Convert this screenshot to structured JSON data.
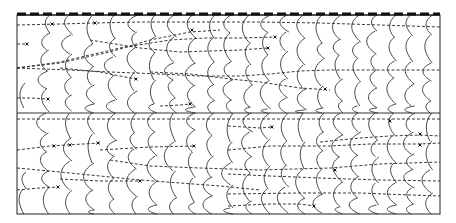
{
  "figure": {
    "frame": {
      "x0": 17,
      "y0": 15,
      "x1": 440,
      "y1": 214
    },
    "midline_y": 113,
    "colors": {
      "ink": "#222222",
      "background": "#ffffff"
    },
    "front_columns_x": [
      22,
      45,
      68,
      90,
      112,
      133,
      153,
      172,
      191,
      210,
      229,
      248,
      266,
      284,
      302,
      320,
      338,
      356,
      374,
      392,
      410,
      428
    ],
    "rows": [
      {
        "y0": 15,
        "y1": 113
      },
      {
        "y0": 113,
        "y1": 214
      }
    ],
    "trajectories": [
      {
        "points": [
          [
            17,
            25
          ],
          [
            60,
            24
          ],
          [
            95,
            23
          ],
          [
            140,
            22
          ],
          [
            200,
            22
          ],
          [
            260,
            22
          ],
          [
            320,
            23
          ],
          [
            380,
            25
          ],
          [
            440,
            27
          ]
        ],
        "markers": [
          [
            52,
            24
          ],
          [
            95,
            23
          ]
        ]
      },
      {
        "points": [
          [
            17,
            44
          ],
          [
            27,
            44
          ]
        ],
        "markers": [
          [
            27,
            44
          ]
        ]
      },
      {
        "points": [
          [
            17,
            68
          ],
          [
            60,
            63
          ],
          [
            110,
            52
          ],
          [
            150,
            40
          ],
          [
            190,
            32
          ],
          [
            220,
            30
          ]
        ],
        "markers": [
          [
            192,
            30
          ]
        ]
      },
      {
        "points": [
          [
            90,
            40
          ],
          [
            140,
            48
          ],
          [
            180,
            52
          ],
          [
            240,
            50
          ],
          [
            268,
            48
          ]
        ],
        "markers": [
          [
            268,
            48
          ]
        ]
      },
      {
        "points": [
          [
            17,
            68
          ],
          [
            70,
            70
          ],
          [
            110,
            72
          ],
          [
            160,
            74
          ],
          [
            200,
            76
          ],
          [
            240,
            76
          ],
          [
            270,
            74
          ],
          [
            300,
            71
          ],
          [
            330,
            70
          ],
          [
            380,
            70
          ],
          [
            440,
            70
          ]
        ],
        "markers": []
      },
      {
        "points": [
          [
            17,
            68
          ],
          [
            60,
            62
          ],
          [
            120,
            48
          ],
          [
            170,
            40
          ],
          [
            205,
            38
          ],
          [
            240,
            38
          ],
          [
            275,
            37
          ]
        ],
        "markers": [
          [
            275,
            37
          ]
        ]
      },
      {
        "points": [
          [
            60,
            68
          ],
          [
            100,
            72
          ],
          [
            130,
            78
          ],
          [
            136,
            79
          ]
        ],
        "markers": [
          [
            136,
            79
          ]
        ]
      },
      {
        "points": [
          [
            150,
            72
          ],
          [
            190,
            74
          ],
          [
            230,
            79
          ],
          [
            260,
            82
          ],
          [
            300,
            88
          ],
          [
            330,
            90
          ]
        ],
        "markers": [
          [
            325,
            89
          ]
        ]
      },
      {
        "points": [
          [
            17,
            98
          ],
          [
            30,
            98
          ],
          [
            48,
            99
          ]
        ],
        "markers": [
          [
            48,
            99
          ]
        ]
      },
      {
        "points": [
          [
            160,
            106
          ],
          [
            180,
            105
          ],
          [
            190,
            104
          ]
        ],
        "markers": [
          [
            190,
            104
          ]
        ]
      },
      {
        "points": [
          [
            17,
            119
          ],
          [
            80,
            119
          ],
          [
            140,
            119
          ],
          [
            200,
            119
          ],
          [
            260,
            119
          ],
          [
            320,
            119
          ],
          [
            380,
            119
          ],
          [
            440,
            119
          ]
        ],
        "markers": [
          [
            390,
            121
          ]
        ]
      },
      {
        "points": [
          [
            17,
            150
          ],
          [
            50,
            146
          ],
          [
            100,
            143
          ]
        ],
        "markers": [
          [
            54,
            146
          ],
          [
            70,
            145
          ],
          [
            98,
            143
          ]
        ]
      },
      {
        "points": [
          [
            100,
            150
          ],
          [
            150,
            147
          ],
          [
            194,
            146
          ]
        ],
        "markers": [
          [
            194,
            146
          ]
        ]
      },
      {
        "points": [
          [
            17,
            168
          ],
          [
            60,
            172
          ],
          [
            100,
            176
          ],
          [
            140,
            180
          ],
          [
            180,
            183
          ],
          [
            220,
            186
          ],
          [
            260,
            190
          ]
        ],
        "markers": []
      },
      {
        "points": [
          [
            17,
            190
          ],
          [
            40,
            188
          ],
          [
            58,
            187
          ]
        ],
        "markers": [
          [
            58,
            187
          ]
        ]
      },
      {
        "points": [
          [
            110,
            160
          ],
          [
            150,
            166
          ],
          [
            200,
            168
          ],
          [
            260,
            170
          ],
          [
            330,
            168
          ],
          [
            380,
            164
          ],
          [
            440,
            162
          ]
        ],
        "markers": []
      },
      {
        "points": [
          [
            60,
            179
          ],
          [
            100,
            181
          ],
          [
            140,
            181
          ]
        ],
        "markers": [
          [
            140,
            181
          ]
        ]
      },
      {
        "points": [
          [
            228,
            150
          ],
          [
            270,
            146
          ],
          [
            330,
            146
          ],
          [
            370,
            144
          ],
          [
            420,
            144
          ],
          [
            440,
            143
          ]
        ],
        "markers": [
          [
            420,
            145
          ]
        ]
      },
      {
        "points": [
          [
            228,
            174
          ],
          [
            270,
            176
          ],
          [
            320,
            178
          ],
          [
            380,
            180
          ],
          [
            440,
            181
          ]
        ],
        "markers": [
          [
            335,
            170
          ]
        ]
      },
      {
        "points": [
          [
            228,
            206
          ],
          [
            270,
            204
          ],
          [
            300,
            204
          ],
          [
            314,
            206
          ]
        ],
        "markers": [
          [
            314,
            206
          ]
        ]
      },
      {
        "points": [
          [
            228,
            194
          ],
          [
            300,
            193
          ],
          [
            360,
            193
          ],
          [
            410,
            195
          ],
          [
            440,
            196
          ]
        ],
        "markers": []
      },
      {
        "points": [
          [
            320,
            142
          ],
          [
            360,
            138
          ],
          [
            390,
            136
          ],
          [
            420,
            135
          ],
          [
            440,
            136
          ]
        ],
        "markers": [
          [
            420,
            134
          ]
        ]
      },
      {
        "points": [
          [
            228,
            126
          ],
          [
            260,
            128
          ],
          [
            272,
            127
          ]
        ],
        "markers": [
          [
            272,
            127
          ]
        ]
      }
    ]
  }
}
